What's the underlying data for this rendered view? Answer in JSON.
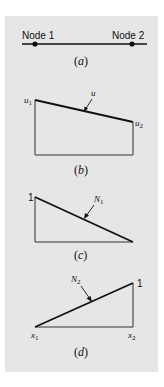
{
  "panel_a": {
    "node1_label": "Node 1",
    "node2_label": "Node 2",
    "caption_open": "(",
    "caption_letter": "a",
    "caption_close": ")"
  },
  "panel_b": {
    "u1_label": "u",
    "u1_sub": "1",
    "u_label": "u",
    "u2_label": "u",
    "u2_sub": "2",
    "caption_open": "(",
    "caption_letter": "b",
    "caption_close": ")"
  },
  "panel_c": {
    "one_label": "1",
    "n1_label": "N",
    "n1_sub": "1",
    "caption_open": "(",
    "caption_letter": "c",
    "caption_close": ")"
  },
  "panel_d": {
    "one_label": "1",
    "n2_label": "N",
    "n2_sub": "2",
    "x1_label": "x",
    "x1_sub": "1",
    "x2_label": "x",
    "x2_sub": "2",
    "caption_open": "(",
    "caption_letter": "d",
    "caption_close": ")"
  },
  "colors": {
    "panel_bg": "#e6e6e6",
    "line": "#111111"
  }
}
